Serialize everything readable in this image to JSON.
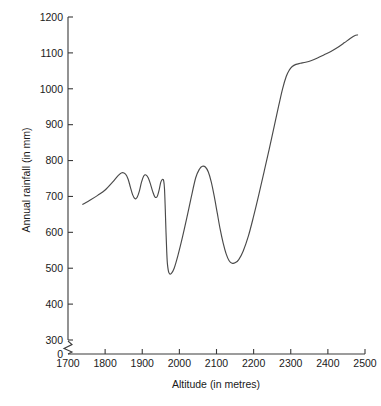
{
  "chart_data": {
    "type": "line",
    "title": "",
    "xlabel": "Altitude (in metres)",
    "ylabel": "Annual rainfall (in mm)",
    "xlim": [
      1700,
      2500
    ],
    "ylim": [
      0,
      1200
    ],
    "y_axis_break": true,
    "y_axis_break_between": [
      0,
      300
    ],
    "grid": false,
    "legend": null,
    "x_ticks": [
      1700,
      1800,
      1900,
      2000,
      2100,
      2200,
      2300,
      2400,
      2500
    ],
    "x_tick_labels": [
      "1700",
      "1800",
      "1900",
      "2000",
      "2100",
      "2200",
      "2300",
      "2400",
      "2500"
    ],
    "y_ticks": [
      0,
      300,
      400,
      500,
      600,
      700,
      800,
      900,
      1000,
      1100,
      1200
    ],
    "y_tick_labels": [
      "0",
      "300",
      "400",
      "500",
      "600",
      "700",
      "800",
      "900",
      "1000",
      "1100",
      "1200"
    ],
    "series": [
      {
        "name": "Annual rainfall",
        "color": "#4a4a4a",
        "x": [
          1740,
          1760,
          1780,
          1800,
          1820,
          1835,
          1845,
          1855,
          1862,
          1868,
          1874,
          1880,
          1886,
          1892,
          1898,
          1904,
          1910,
          1916,
          1922,
          1928,
          1934,
          1940,
          1945,
          1950,
          1955,
          1958,
          1960,
          1962,
          1964,
          1966,
          1968,
          1972,
          1978,
          1986,
          1996,
          2008,
          2020,
          2032,
          2044,
          2054,
          2062,
          2070,
          2078,
          2086,
          2094,
          2102,
          2110,
          2118,
          2126,
          2134,
          2142,
          2150,
          2160,
          2172,
          2186,
          2200,
          2214,
          2228,
          2242,
          2256,
          2268,
          2278,
          2288,
          2296,
          2304,
          2314,
          2326,
          2340,
          2356,
          2372,
          2390,
          2408,
          2426,
          2444,
          2460,
          2472,
          2480
        ],
        "y": [
          678,
          690,
          703,
          718,
          740,
          758,
          766,
          762,
          748,
          726,
          705,
          694,
          697,
          714,
          740,
          757,
          760,
          752,
          735,
          714,
          699,
          699,
          716,
          740,
          748,
          742,
          720,
          665,
          600,
          545,
          510,
          487,
          485,
          500,
          535,
          585,
          640,
          698,
          752,
          776,
          784,
          782,
          768,
          740,
          700,
          654,
          608,
          570,
          540,
          521,
          514,
          515,
          524,
          548,
          590,
          645,
          705,
          768,
          832,
          898,
          955,
          1000,
          1035,
          1052,
          1062,
          1068,
          1071,
          1074,
          1079,
          1086,
          1095,
          1104,
          1115,
          1128,
          1140,
          1148,
          1150
        ]
      }
    ]
  },
  "axis_labels": {
    "x_title": "Altitude (in metres)",
    "y_title": "Annual rainfall (in mm)"
  }
}
